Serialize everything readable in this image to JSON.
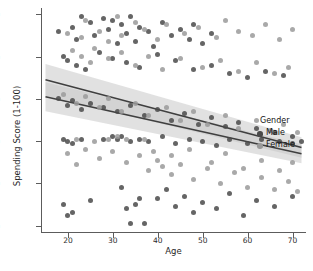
{
  "chart_data": {
    "type": "scatter",
    "title": "",
    "subtitle": "",
    "xlabel": "Age",
    "ylabel": "Spending Score (1-100)",
    "xlim": [
      14,
      73
    ],
    "ylim": [
      -3,
      103
    ],
    "xticks": [
      20,
      30,
      40,
      50,
      60,
      70
    ],
    "yticks": [
      0,
      20,
      40,
      60,
      80,
      100
    ],
    "grid": false,
    "legend": {
      "title": "Gender",
      "position": "center-right-inside",
      "entries": [
        {
          "label": "Male",
          "color": "#4a4a4a"
        },
        {
          "label": "Female",
          "color": "#9a9a9a"
        }
      ]
    },
    "regression": {
      "show_confidence_band": true,
      "band_color": "#c9c9c9",
      "line_color": "#3f3f3f",
      "series": [
        {
          "name": "Male",
          "x0": 15,
          "y0": 69,
          "x1": 72,
          "y1": 37,
          "band": 6.5
        },
        {
          "name": "Female",
          "x0": 15,
          "y0": 61,
          "x1": 72,
          "y1": 34,
          "band": 6.0
        }
      ]
    },
    "series": [
      {
        "name": "Male",
        "color": "#4a4a4a",
        "points": [
          [
            18,
            92
          ],
          [
            21,
            94
          ],
          [
            22,
            88
          ],
          [
            23,
            99
          ],
          [
            25,
            96
          ],
          [
            26,
            90
          ],
          [
            28,
            98
          ],
          [
            29,
            93
          ],
          [
            30,
            97
          ],
          [
            31,
            86
          ],
          [
            32,
            95
          ],
          [
            33,
            91
          ],
          [
            34,
            99
          ],
          [
            35,
            87
          ],
          [
            36,
            94
          ],
          [
            38,
            92
          ],
          [
            39,
            85
          ],
          [
            41,
            96
          ],
          [
            43,
            90
          ],
          [
            45,
            93
          ],
          [
            47,
            88
          ],
          [
            48,
            95
          ],
          [
            50,
            86
          ],
          [
            52,
            91
          ],
          [
            19,
            80
          ],
          [
            20,
            78
          ],
          [
            22,
            76
          ],
          [
            24,
            74
          ],
          [
            27,
            82
          ],
          [
            30,
            79
          ],
          [
            33,
            77
          ],
          [
            36,
            75
          ],
          [
            40,
            81
          ],
          [
            44,
            78
          ],
          [
            48,
            74
          ],
          [
            52,
            76
          ],
          [
            56,
            72
          ],
          [
            60,
            70
          ],
          [
            64,
            73
          ],
          [
            68,
            71
          ],
          [
            18,
            60
          ],
          [
            20,
            57
          ],
          [
            21,
            59
          ],
          [
            23,
            55
          ],
          [
            25,
            58
          ],
          [
            28,
            56
          ],
          [
            31,
            54
          ],
          [
            34,
            57
          ],
          [
            37,
            52
          ],
          [
            40,
            55
          ],
          [
            43,
            50
          ],
          [
            46,
            53
          ],
          [
            49,
            48
          ],
          [
            52,
            51
          ],
          [
            55,
            47
          ],
          [
            58,
            49
          ],
          [
            62,
            46
          ],
          [
            66,
            44
          ],
          [
            70,
            42
          ],
          [
            72,
            40
          ],
          [
            19,
            41
          ],
          [
            20,
            40
          ],
          [
            21,
            39
          ],
          [
            23,
            41
          ],
          [
            28,
            41
          ],
          [
            30,
            42
          ],
          [
            31,
            41
          ],
          [
            32,
            42
          ],
          [
            34,
            40
          ],
          [
            36,
            41
          ],
          [
            38,
            40
          ],
          [
            41,
            42
          ],
          [
            44,
            39
          ],
          [
            47,
            41
          ],
          [
            50,
            40
          ],
          [
            53,
            38
          ],
          [
            56,
            41
          ],
          [
            60,
            39
          ],
          [
            63,
            41
          ],
          [
            67,
            40
          ],
          [
            70,
            39
          ],
          [
            19,
            10
          ],
          [
            20,
            5
          ],
          [
            21,
            6
          ],
          [
            25,
            12
          ],
          [
            32,
            18
          ],
          [
            33,
            8
          ],
          [
            34,
            1
          ],
          [
            35,
            10
          ],
          [
            36,
            13
          ],
          [
            37,
            1
          ],
          [
            40,
            13
          ],
          [
            42,
            17
          ],
          [
            44,
            9
          ],
          [
            46,
            14
          ],
          [
            48,
            6
          ],
          [
            50,
            11
          ],
          [
            53,
            8
          ],
          [
            56,
            15
          ],
          [
            59,
            5
          ],
          [
            62,
            12
          ],
          [
            66,
            9
          ],
          [
            70,
            14
          ]
        ]
      },
      {
        "name": "Female",
        "color": "#9a9a9a",
        "points": [
          [
            20,
            91
          ],
          [
            23,
            89
          ],
          [
            24,
            97
          ],
          [
            27,
            92
          ],
          [
            29,
            87
          ],
          [
            31,
            99
          ],
          [
            32,
            90
          ],
          [
            35,
            96
          ],
          [
            37,
            93
          ],
          [
            40,
            88
          ],
          [
            42,
            95
          ],
          [
            46,
            91
          ],
          [
            49,
            94
          ],
          [
            53,
            89
          ],
          [
            55,
            97
          ],
          [
            58,
            92
          ],
          [
            61,
            90
          ],
          [
            64,
            95
          ],
          [
            67,
            88
          ],
          [
            70,
            93
          ],
          [
            21,
            83
          ],
          [
            23,
            80
          ],
          [
            25,
            77
          ],
          [
            26,
            84
          ],
          [
            29,
            79
          ],
          [
            32,
            82
          ],
          [
            35,
            76
          ],
          [
            38,
            80
          ],
          [
            41,
            74
          ],
          [
            45,
            79
          ],
          [
            50,
            75
          ],
          [
            54,
            78
          ],
          [
            58,
            73
          ],
          [
            62,
            77
          ],
          [
            66,
            72
          ],
          [
            69,
            75
          ],
          [
            19,
            62
          ],
          [
            22,
            58
          ],
          [
            24,
            61
          ],
          [
            27,
            56
          ],
          [
            29,
            60
          ],
          [
            32,
            54
          ],
          [
            35,
            58
          ],
          [
            38,
            52
          ],
          [
            42,
            56
          ],
          [
            45,
            50
          ],
          [
            48,
            54
          ],
          [
            51,
            48
          ],
          [
            55,
            52
          ],
          [
            58,
            46
          ],
          [
            62,
            50
          ],
          [
            65,
            45
          ],
          [
            68,
            48
          ],
          [
            71,
            44
          ],
          [
            20,
            34
          ],
          [
            22,
            29
          ],
          [
            24,
            36
          ],
          [
            27,
            32
          ],
          [
            30,
            35
          ],
          [
            33,
            30
          ],
          [
            36,
            33
          ],
          [
            38,
            26
          ],
          [
            40,
            31
          ],
          [
            43,
            24
          ],
          [
            45,
            29
          ],
          [
            48,
            22
          ],
          [
            51,
            27
          ],
          [
            54,
            20
          ],
          [
            57,
            25
          ],
          [
            60,
            18
          ],
          [
            63,
            23
          ],
          [
            66,
            17
          ],
          [
            69,
            21
          ],
          [
            71,
            16
          ],
          [
            22,
            41
          ],
          [
            26,
            40
          ],
          [
            29,
            41
          ],
          [
            31,
            42
          ],
          [
            33,
            41
          ],
          [
            37,
            41
          ],
          [
            39,
            35
          ],
          [
            41,
            28
          ],
          [
            43,
            33
          ],
          [
            47,
            36
          ],
          [
            52,
            30
          ],
          [
            55,
            34
          ],
          [
            59,
            27
          ],
          [
            63,
            31
          ],
          [
            67,
            26
          ],
          [
            70,
            30
          ]
        ]
      }
    ]
  },
  "caption": ""
}
